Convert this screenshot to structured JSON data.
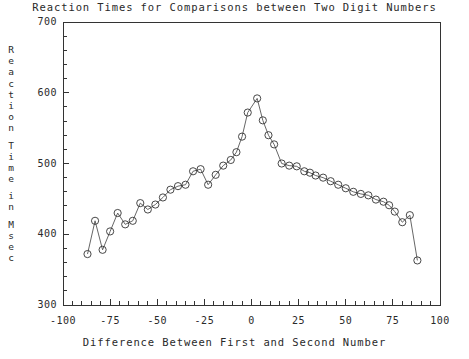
{
  "chart_data": {
    "type": "line",
    "title": "Reaction Times for Comparisons between Two Digit Numbers",
    "xlabel": "Difference Between First and Second Number",
    "ylabel": "Reaction Time in Msec",
    "ylabel_chars": [
      "R",
      "e",
      "a",
      "c",
      "t",
      "i",
      "o",
      "n",
      "",
      "T",
      "i",
      "m",
      "e",
      "",
      "i",
      "n",
      "",
      "M",
      "s",
      "e",
      "c"
    ],
    "xlim": [
      -100,
      100
    ],
    "ylim": [
      300,
      700
    ],
    "xticks": [
      -100,
      -75,
      -50,
      -25,
      0,
      25,
      50,
      75,
      100
    ],
    "xtick_labels": [
      "-100",
      "-75",
      "-50",
      "-25",
      "0",
      "25",
      "50",
      "75",
      "100"
    ],
    "yticks": [
      300,
      400,
      500,
      600,
      700
    ],
    "ytick_labels": [
      "300",
      "400",
      "500",
      "600",
      "700"
    ],
    "x_minor_step": 5,
    "y_minor_step": 20,
    "grid": false,
    "legend": "none",
    "marker": "open-circle",
    "line_color": "#555555",
    "marker_color": "#333333",
    "x": [
      -87,
      -83,
      -79,
      -75,
      -71,
      -67,
      -63,
      -59,
      -55,
      -51,
      -47,
      -43,
      -39,
      -35,
      -31,
      -27,
      -23,
      -19,
      -15,
      -11,
      -8,
      -5,
      -2,
      3,
      6,
      9,
      12,
      16,
      20,
      24,
      28,
      31,
      34,
      38,
      42,
      46,
      50,
      54,
      58,
      62,
      66,
      70,
      73,
      76,
      80,
      84,
      88
    ],
    "y": [
      372,
      419,
      378,
      404,
      430,
      414,
      419,
      444,
      435,
      442,
      452,
      463,
      468,
      470,
      489,
      492,
      470,
      484,
      497,
      505,
      516,
      538,
      572,
      592,
      561,
      540,
      527,
      500,
      497,
      496,
      489,
      487,
      483,
      480,
      475,
      470,
      465,
      460,
      457,
      455,
      449,
      446,
      441,
      432,
      417,
      427,
      363
    ]
  }
}
